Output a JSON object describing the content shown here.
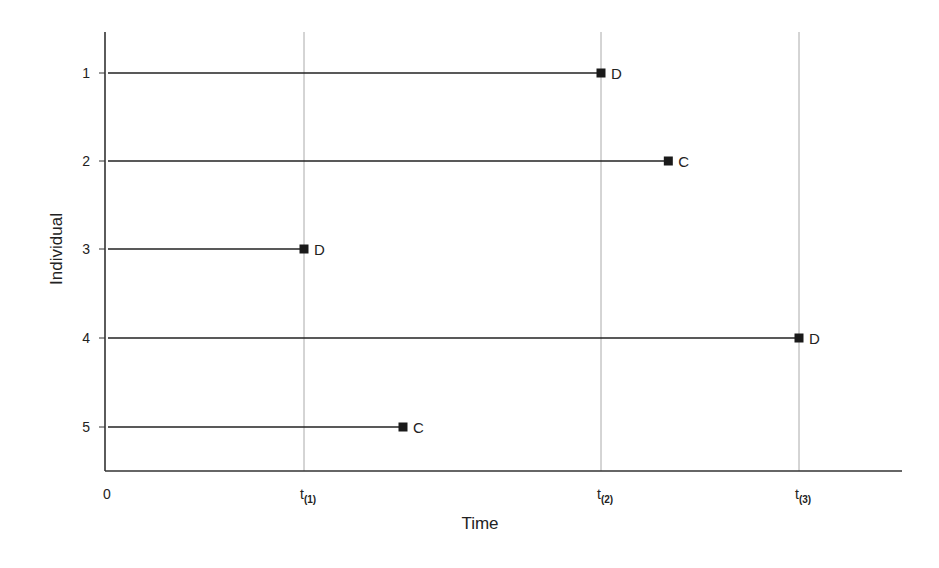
{
  "chart_data": {
    "type": "line",
    "title": "",
    "xlabel": "Time",
    "ylabel": "Individual",
    "x_ticks": [
      {
        "label": "0",
        "base": "0",
        "sub": "",
        "value": 0
      },
      {
        "label": "t(1)",
        "base": "t",
        "sub": "(1)",
        "value": 1.0
      },
      {
        "label": "t(2)",
        "base": "t",
        "sub": "(2)",
        "value": 2.5
      },
      {
        "label": "t(3)",
        "base": "t",
        "sub": "(3)",
        "value": 3.5
      }
    ],
    "y_ticks": [
      "1",
      "2",
      "3",
      "4",
      "5"
    ],
    "vertical_gridlines_at": [
      "t(1)",
      "t(2)",
      "t(3)"
    ],
    "xlim": [
      0,
      4.0
    ],
    "series": [
      {
        "individual": "1",
        "start": 0,
        "end": 2.5,
        "end_label": "t(2)",
        "status": "D"
      },
      {
        "individual": "2",
        "start": 0,
        "end": 2.84,
        "end_label": "",
        "status": "C"
      },
      {
        "individual": "3",
        "start": 0,
        "end": 1.0,
        "end_label": "t(1)",
        "status": "D"
      },
      {
        "individual": "4",
        "start": 0,
        "end": 3.5,
        "end_label": "t(3)",
        "status": "D"
      },
      {
        "individual": "5",
        "start": 0,
        "end": 1.5,
        "end_label": "",
        "status": "C"
      }
    ],
    "legend": [],
    "annotations": [
      "D = death (event)",
      "C = censored"
    ],
    "grid": "vertical dotted lines at event times"
  },
  "colors": {
    "axis": "#333333",
    "line": "#222222",
    "marker": "#1a1a1a",
    "gridline": "#aaaaaa"
  }
}
